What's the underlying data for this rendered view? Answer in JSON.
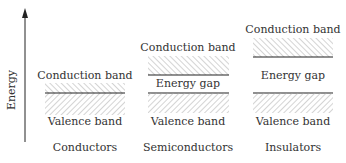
{
  "axis": {
    "label": "Energy"
  },
  "columns": [
    {
      "title": "Conductors",
      "conduction_label": "Conduction band",
      "valence_label": "Valence band",
      "gap_label": ""
    },
    {
      "title": "Semiconductors",
      "conduction_label": "Conduction band",
      "valence_label": "Valence band",
      "gap_label": "Energy gap"
    },
    {
      "title": "Insulators",
      "conduction_label": "Conduction band",
      "valence_label": "Valence band",
      "gap_label": "Energy gap"
    }
  ]
}
